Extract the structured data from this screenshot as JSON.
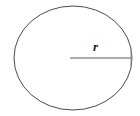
{
  "figure": {
    "kind": "geometry-diagram",
    "background_color": "#ffffff",
    "width": 140,
    "height": 116
  },
  "circle": {
    "name": "circle-outline",
    "center_x": 73,
    "center_y": 58,
    "radius_x": 59,
    "radius_y": 52,
    "stroke_color": "#4a4a4a",
    "stroke_width": 1,
    "fill": "none"
  },
  "radius": {
    "name": "radius-segment",
    "label": "r",
    "start_x": 70,
    "start_y": 58,
    "end_x": 132,
    "end_y": 58,
    "stroke_color": "#8f8f8f",
    "stroke_width": 1.4,
    "label_x": 93,
    "label_y": 40,
    "label_color": "#1b1b1b"
  },
  "endpoint_tick": {
    "name": "radius-endpoint-tick",
    "x": 131,
    "top_y": 50,
    "bottom_y": 66,
    "stroke_color": "#8f8f8f",
    "stroke_width": 1
  }
}
